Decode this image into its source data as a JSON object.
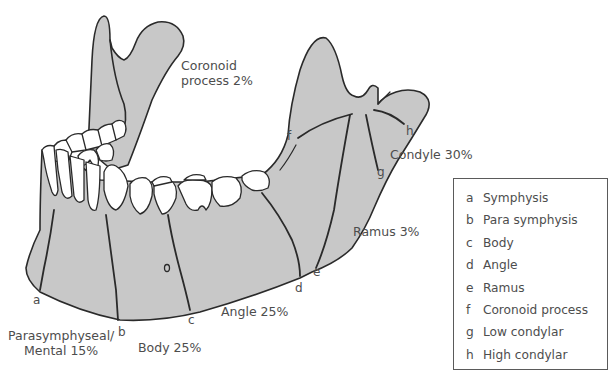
{
  "figure": {
    "fill_color": "#c8c8c8",
    "outline_color": "#2a2a2a",
    "tooth_color": "#ffffff"
  },
  "region_labels": [
    {
      "id": "coronoid",
      "line1": "Coronoid",
      "line2": "process 2%"
    },
    {
      "id": "condyle",
      "line1": "Condyle 30%"
    },
    {
      "id": "ramus",
      "line1": "Ramus 3%"
    },
    {
      "id": "angle",
      "line1": "Angle 25%"
    },
    {
      "id": "body",
      "line1": "Body 25%"
    },
    {
      "id": "parasymphyseal",
      "line1": "Parasymphyseal/",
      "line2": "Mental 15%"
    }
  ],
  "site_letters": {
    "a": "a",
    "b": "b",
    "c": "c",
    "d": "d",
    "e": "e",
    "f": "f",
    "g": "g",
    "h": "h"
  },
  "legend": {
    "items": [
      {
        "key": "a",
        "label": "Symphysis"
      },
      {
        "key": "b",
        "label": "Para symphysis"
      },
      {
        "key": "c",
        "label": "Body"
      },
      {
        "key": "d",
        "label": "Angle"
      },
      {
        "key": "e",
        "label": "Ramus"
      },
      {
        "key": "f",
        "label": "Coronoid process"
      },
      {
        "key": "g",
        "label": "Low condylar"
      },
      {
        "key": "h",
        "label": "High condylar"
      }
    ]
  }
}
